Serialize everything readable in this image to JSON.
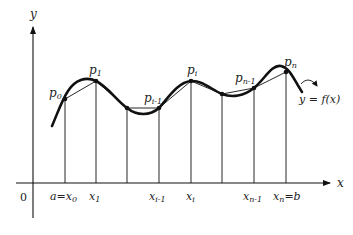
{
  "diagram": {
    "type": "riemann-polygon-approximation",
    "axes": {
      "x_label": "x",
      "y_label": "y",
      "origin_label": "0"
    },
    "curve_label": "y = f(x)",
    "points": [
      {
        "name": "p0",
        "base": "p",
        "sub": "0",
        "x": 65,
        "y": 99
      },
      {
        "name": "p1",
        "base": "p",
        "sub": "1",
        "x": 96,
        "y": 81
      },
      {
        "name": "q",
        "base": "",
        "sub": "",
        "x": 127,
        "y": 108
      },
      {
        "name": "p_i-1",
        "base": "p",
        "sub": "i-1",
        "x": 159,
        "y": 108
      },
      {
        "name": "p_i",
        "base": "p",
        "sub": "i",
        "x": 191,
        "y": 81
      },
      {
        "name": "r",
        "base": "",
        "sub": "",
        "x": 222,
        "y": 94
      },
      {
        "name": "p_n-1",
        "base": "p",
        "sub": "n-1",
        "x": 254,
        "y": 88
      },
      {
        "name": "p_n",
        "base": "p",
        "sub": "n",
        "x": 286,
        "y": 72
      }
    ],
    "x_ticks": [
      {
        "pre": "a=",
        "base": "x",
        "sub": "0",
        "post": "",
        "x": 65
      },
      {
        "pre": "",
        "base": "x",
        "sub": "1",
        "post": "",
        "x": 96
      },
      {
        "pre": "",
        "base": "x",
        "sub": "i-1",
        "post": "",
        "x": 159
      },
      {
        "pre": "",
        "base": "x",
        "sub": "i",
        "post": "",
        "x": 191
      },
      {
        "pre": "",
        "base": "x",
        "sub": "n-1",
        "post": "",
        "x": 254
      },
      {
        "pre": "",
        "base": "x",
        "sub": "n",
        "post": "=b",
        "x": 286
      }
    ],
    "labels": {
      "p0": {
        "base": "p",
        "sub": "0"
      },
      "p1": {
        "base": "p",
        "sub": "1"
      },
      "pim1": {
        "base": "p",
        "sub": "i-1"
      },
      "pi": {
        "base": "p",
        "sub": "i"
      },
      "pnm1": {
        "base": "p",
        "sub": "n-1"
      },
      "pn": {
        "base": "p",
        "sub": "n"
      },
      "x0": {
        "pre": "a=",
        "base": "x",
        "sub": "0"
      },
      "x1": {
        "base": "x",
        "sub": "1"
      },
      "xim1": {
        "base": "x",
        "sub": "i-1"
      },
      "xi": {
        "base": "x",
        "sub": "i"
      },
      "xnm1": {
        "base": "x",
        "sub": "n-1"
      },
      "xn": {
        "base": "x",
        "sub": "n",
        "post": "=b"
      }
    },
    "colors": {
      "stroke": "#111111",
      "background": "#ffffff"
    }
  }
}
